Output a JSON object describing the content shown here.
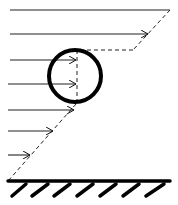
{
  "diagram": {
    "type": "velocity-profile",
    "colors": {
      "stroke": "#111111",
      "background": "#ffffff"
    },
    "profile_arrows": [
      {
        "y": 10,
        "x_end": 170
      },
      {
        "y": 34,
        "x_end": 148
      },
      {
        "y": 60,
        "x_end": 76
      },
      {
        "y": 84,
        "x_end": 76
      },
      {
        "y": 110,
        "x_end": 74
      },
      {
        "y": 131,
        "x_end": 53
      },
      {
        "y": 155,
        "x_end": 30
      }
    ],
    "cylinder": {
      "cx": 75,
      "cy": 76,
      "r": 27
    },
    "wall": {
      "y": 181,
      "x_start": 8,
      "x_end": 170,
      "hatch_count": 7
    }
  }
}
